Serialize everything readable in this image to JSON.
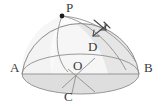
{
  "figure": {
    "type": "geometry-diagram",
    "width": 159,
    "height": 106,
    "background_color": "#ffffff",
    "line_color": "#8f8f8f",
    "label_color": "#3a3a3a",
    "dome_fill_color": "#e8e8e8",
    "base_fill_color": "#dcdcdc",
    "dot_color": "#1c1c1c",
    "labels": [
      {
        "id": "P",
        "text": "P",
        "x": 66,
        "y": 12,
        "role": "apex-point-on-sphere"
      },
      {
        "id": "A",
        "text": "A",
        "x": 10,
        "y": 72,
        "role": "left-endpoint-of-diameter"
      },
      {
        "id": "B",
        "text": "B",
        "x": 144,
        "y": 72,
        "role": "right-endpoint-of-diameter"
      },
      {
        "id": "C",
        "text": "C",
        "x": 64,
        "y": 101,
        "role": "front-point-on-base-circle"
      },
      {
        "id": "D",
        "text": "D",
        "x": 88,
        "y": 51,
        "role": "interior-point-on-segment"
      },
      {
        "id": "O",
        "text": "O",
        "x": 73,
        "y": 70,
        "role": "center-of-base-circle"
      }
    ],
    "points": [
      {
        "id": "P",
        "x": 62,
        "y": 16,
        "marked": true
      },
      {
        "id": "O",
        "x": 76,
        "y": 75,
        "marked": false
      },
      {
        "id": "A",
        "x": 22,
        "y": 74,
        "marked": false
      },
      {
        "id": "B",
        "x": 139,
        "y": 74,
        "marked": false
      },
      {
        "id": "C",
        "x": 73,
        "y": 94,
        "marked": false
      },
      {
        "id": "D",
        "x": 95,
        "y": 58,
        "marked": false
      }
    ],
    "annotation": {
      "name": "angle-arrow-marks",
      "description": "pair of crossing double-headed arrows indicating angle or direction near upper right of dome",
      "center_x": 101,
      "center_y": 27
    }
  }
}
